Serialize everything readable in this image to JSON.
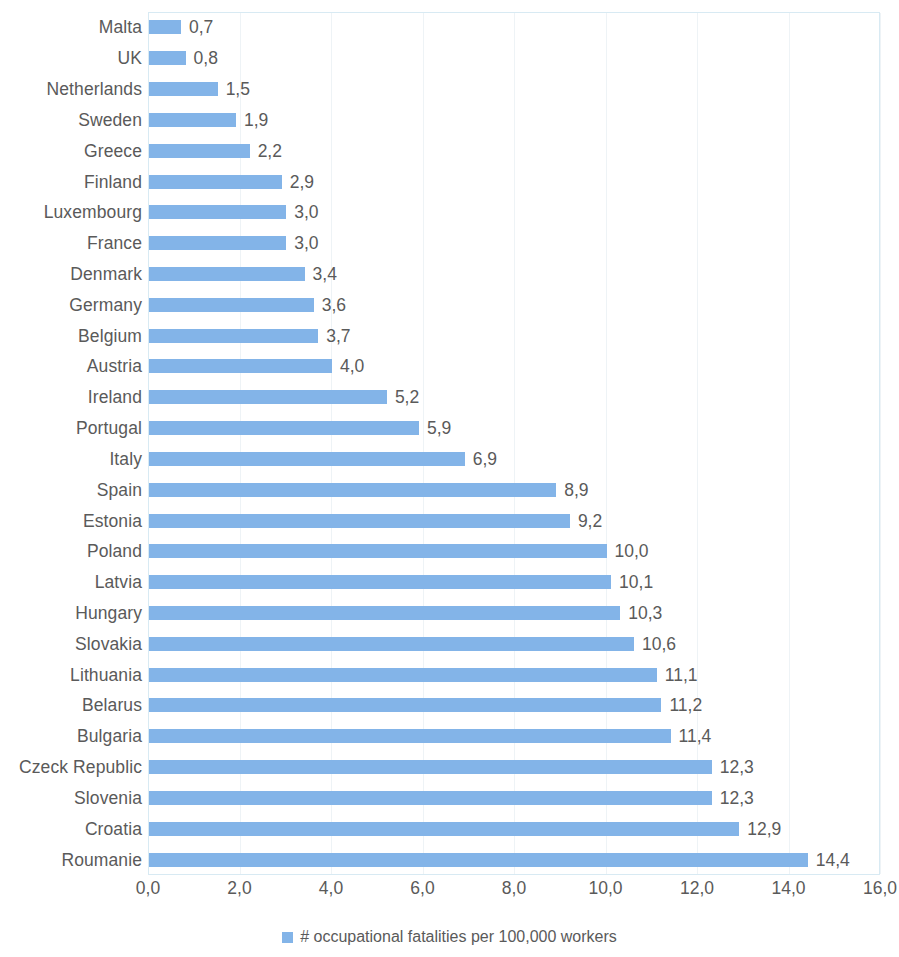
{
  "chart_data": {
    "type": "bar",
    "orientation": "horizontal",
    "title": "",
    "xlabel": "",
    "ylabel": "",
    "xlim": [
      0,
      16
    ],
    "xticks": [
      "0,0",
      "2,0",
      "4,0",
      "6,0",
      "8,0",
      "10,0",
      "12,0",
      "14,0",
      "16,0"
    ],
    "xtick_values": [
      0,
      2,
      4,
      6,
      8,
      10,
      12,
      14,
      16
    ],
    "grid": true,
    "legend_position": "bottom",
    "legend": [
      "# occupational fatalities per 100,000 workers"
    ],
    "decimal_separator": ",",
    "series": [
      {
        "name": "# occupational fatalities per 100,000 workers",
        "color": "#83b4e8",
        "values": [
          0.7,
          0.8,
          1.5,
          1.9,
          2.2,
          2.9,
          3.0,
          3.0,
          3.4,
          3.6,
          3.7,
          4.0,
          5.2,
          5.9,
          6.9,
          8.9,
          9.2,
          10.0,
          10.1,
          10.3,
          10.6,
          11.1,
          11.2,
          11.4,
          12.3,
          12.3,
          12.9,
          14.4
        ]
      }
    ],
    "categories": [
      "Malta",
      "UK",
      "Netherlands",
      "Sweden",
      "Greece",
      "Finland",
      "Luxembourg",
      "France",
      "Denmark",
      "Germany",
      "Belgium",
      "Austria",
      "Ireland",
      "Portugal",
      "Italy",
      "Spain",
      "Estonia",
      "Poland",
      "Latvia",
      "Hungary",
      "Slovakia",
      "Lithuania",
      "Belarus",
      "Bulgaria",
      "Czeck Republic",
      "Slovenia",
      "Croatia",
      "Roumanie"
    ],
    "data_labels": [
      "0,7",
      "0,8",
      "1,5",
      "1,9",
      "2,2",
      "2,9",
      "3,0",
      "3,0",
      "3,4",
      "3,6",
      "3,7",
      "4,0",
      "5,2",
      "5,9",
      "6,9",
      "8,9",
      "9,2",
      "10,0",
      "10,1",
      "10,3",
      "10,6",
      "11,1",
      "11,2",
      "11,4",
      "12,3",
      "12,3",
      "12,9",
      "14,4"
    ]
  },
  "legend": {
    "marker": "legend-swatch-blue",
    "label": "# occupational fatalities per 100,000 workers"
  },
  "colors": {
    "bar": "#83b4e8",
    "text": "#5a5a5a",
    "gridline": "#eef3f6",
    "plot_border": "#d8eaf3",
    "background": "#ffffff"
  }
}
